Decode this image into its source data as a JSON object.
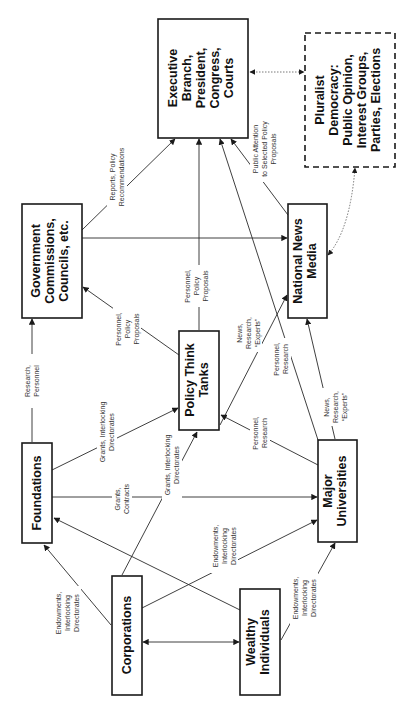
{
  "diagram": {
    "orientation": "rotated-90-ccw",
    "nodes": {
      "executive": {
        "lines": [
          "Executive",
          "Branch,",
          "President,",
          "Congress,",
          "Courts"
        ]
      },
      "pluralist": {
        "lines": [
          "Pluralist",
          "Democracy:",
          "Public Opinion,",
          "Interest Groups,",
          "Parties, Elections"
        ]
      },
      "government": {
        "lines": [
          "Government",
          "Commissions,",
          "Councils, etc."
        ]
      },
      "media": {
        "lines": [
          "National News",
          "Media"
        ]
      },
      "thinktanks": {
        "lines": [
          "Policy Think",
          "Tanks"
        ]
      },
      "foundations": {
        "lines": [
          "Foundations"
        ]
      },
      "universities": {
        "lines": [
          "Major",
          "Universities"
        ]
      },
      "corporations": {
        "lines": [
          "Corporations"
        ]
      },
      "wealthy": {
        "lines": [
          "Wealthy",
          "Individuals"
        ]
      }
    },
    "edge_labels": {
      "gov_exec": [
        "Reports, Policy",
        "Recommendations"
      ],
      "media_exec": [
        "Public Attention",
        "to Selected Policy",
        "Proposals"
      ],
      "found_gov": [
        "Research,",
        "Personnel"
      ],
      "tt_gov": [
        "Personnel,",
        "Policy",
        "Proposals"
      ],
      "tt_exec": [
        "Personnel,",
        "Policy",
        "Proposals"
      ],
      "tt_media": [
        "News,",
        "Research,",
        "“Experts”"
      ],
      "univ_exec": [
        "Personnel,",
        "Research"
      ],
      "univ_tt": [
        "Personnel,",
        "Research"
      ],
      "univ_media": [
        "News,",
        "Research,",
        "“Experts”"
      ],
      "found_tt": [
        "Grants, Interlocking",
        "Directorates"
      ],
      "corp_tt": [
        "Grants, Interlocking",
        "Directorates"
      ],
      "found_univ": [
        "Grants,",
        "Contracts"
      ],
      "corp_found": [
        "Endowments,",
        "Interlocking",
        "Directorates"
      ],
      "corp_univ": [
        "Endowments,",
        "Interlocking",
        "Directorates"
      ],
      "wealthy_univ": [
        "Endowments,",
        "Interlocking",
        "Directorates"
      ]
    }
  }
}
